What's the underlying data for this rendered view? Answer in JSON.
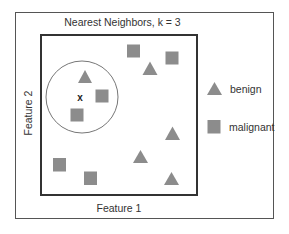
{
  "diagram": {
    "title": "Nearest Neighbors, k = 3",
    "xlabel": "Feature 1",
    "ylabel": "Feature 2",
    "query_marker": "x",
    "shape_color": "#8c8c8c",
    "legend": [
      {
        "shape": "triangle",
        "label": "benign"
      },
      {
        "shape": "square",
        "label": "malignant"
      }
    ],
    "points": [
      {
        "class": "benign",
        "shape": "triangle",
        "x": 85,
        "y": 77,
        "in_neighborhood": true
      },
      {
        "class": "malignant",
        "shape": "square",
        "x": 102,
        "y": 96,
        "in_neighborhood": true
      },
      {
        "class": "malignant",
        "shape": "square",
        "x": 77,
        "y": 115,
        "in_neighborhood": true
      },
      {
        "class": "malignant",
        "shape": "square",
        "x": 133,
        "y": 51
      },
      {
        "class": "malignant",
        "shape": "square",
        "x": 172,
        "y": 58
      },
      {
        "class": "benign",
        "shape": "triangle",
        "x": 150,
        "y": 68
      },
      {
        "class": "benign",
        "shape": "triangle",
        "x": 172,
        "y": 133
      },
      {
        "class": "benign",
        "shape": "triangle",
        "x": 140,
        "y": 157
      },
      {
        "class": "benign",
        "shape": "triangle",
        "x": 171,
        "y": 179
      },
      {
        "class": "malignant",
        "shape": "square",
        "x": 59,
        "y": 165
      },
      {
        "class": "malignant",
        "shape": "square",
        "x": 90,
        "y": 178
      }
    ]
  }
}
